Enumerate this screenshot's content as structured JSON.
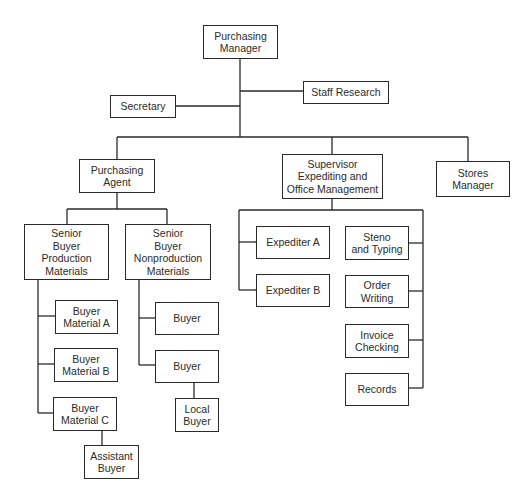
{
  "diagram": {
    "type": "organization-chart",
    "line_color": "#2a2a2a",
    "box_border_color": "#2a2a2a",
    "text_color": "#2b2b2b",
    "background": "#ffffff"
  },
  "nodes": {
    "purchasing_manager": {
      "label": "Purchasing\nManager"
    },
    "staff_research": {
      "label": "Staff Research"
    },
    "secretary": {
      "label": "Secretary"
    },
    "purchasing_agent": {
      "label": "Purchasing\nAgent"
    },
    "supervisor": {
      "label": "Supervisor\nExpediting and\nOffice Management"
    },
    "stores_manager": {
      "label": "Stores\nManager"
    },
    "senior_buyer_production": {
      "label": "Senior\nBuyer\nProduction\nMaterials"
    },
    "senior_buyer_nonproduction": {
      "label": "Senior\nBuyer\nNonproduction\nMaterials"
    },
    "buyer_material_a": {
      "label": "Buyer\nMaterial A"
    },
    "buyer_material_b": {
      "label": "Buyer\nMaterial B"
    },
    "buyer_material_c": {
      "label": "Buyer\nMaterial C"
    },
    "assistant_buyer": {
      "label": "Assistant\nBuyer"
    },
    "buyer_1": {
      "label": "Buyer"
    },
    "buyer_2": {
      "label": "Buyer"
    },
    "local_buyer": {
      "label": "Local\nBuyer"
    },
    "expediter_a": {
      "label": "Expediter A"
    },
    "expediter_b": {
      "label": "Expediter B"
    },
    "steno_typing": {
      "label": "Steno\nand Typing"
    },
    "order_writing": {
      "label": "Order\nWriting"
    },
    "invoice_checking": {
      "label": "Invoice\nChecking"
    },
    "records": {
      "label": "Records"
    }
  },
  "hierarchy": {
    "Purchasing Manager": [
      "Staff Research",
      "Secretary",
      "Purchasing Agent",
      "Supervisor Expediting and Office Management",
      "Stores Manager"
    ],
    "Purchasing Agent": [
      "Senior Buyer Production Materials",
      "Senior Buyer Nonproduction Materials"
    ],
    "Senior Buyer Production Materials": [
      "Buyer Material A",
      "Buyer Material B",
      "Buyer Material C"
    ],
    "Buyer Material C": [
      "Assistant Buyer"
    ],
    "Senior Buyer Nonproduction Materials": [
      "Buyer",
      "Buyer (2)"
    ],
    "Buyer (2)": [
      "Local Buyer"
    ],
    "Supervisor Expediting and Office Management": [
      "Expediter A",
      "Expediter B",
      "Steno and Typing",
      "Order Writing",
      "Invoice Checking",
      "Records"
    ]
  }
}
